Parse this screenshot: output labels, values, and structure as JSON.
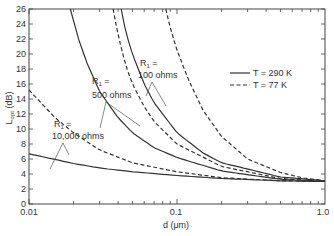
{
  "chart_data": {
    "type": "line",
    "title": "",
    "xlabel": "d (μm)",
    "ylabel": "L_opt (dB)",
    "xscale": "log",
    "xlim": [
      0.01,
      1.0
    ],
    "ylim": [
      0,
      26
    ],
    "x_ticks": [
      "0.01",
      "0.1",
      "1.0"
    ],
    "y_ticks": [
      "0",
      "2",
      "4",
      "6",
      "8",
      "10",
      "12",
      "14",
      "16",
      "18",
      "20",
      "22",
      "24",
      "26"
    ],
    "grid": false,
    "legend": {
      "position": "upper right",
      "entries": [
        {
          "label": "T = 290 K",
          "style": "solid"
        },
        {
          "label": "T = 77 K",
          "style": "dashed"
        }
      ]
    },
    "series": [
      {
        "name": "R1 = 10,000 ohms, T = 290 K",
        "style": "solid",
        "x": [
          0.01,
          0.02,
          0.03,
          0.05,
          0.1,
          0.2,
          0.5,
          1.0
        ],
        "y": [
          6.7,
          5.4,
          4.8,
          4.3,
          3.8,
          3.4,
          3.1,
          3.0
        ]
      },
      {
        "name": "R1 = 10,000 ohms, T = 77 K",
        "style": "dashed",
        "x": [
          0.01,
          0.015,
          0.02,
          0.03,
          0.05,
          0.1,
          0.2,
          0.5,
          1.0
        ],
        "y": [
          15.2,
          11.5,
          9.5,
          7.2,
          5.5,
          4.3,
          3.5,
          3.1,
          3.0
        ]
      },
      {
        "name": "R1 = 500 ohms, T = 290 K",
        "style": "solid",
        "x": [
          0.019,
          0.022,
          0.025,
          0.03,
          0.04,
          0.05,
          0.07,
          0.1,
          0.2,
          0.5,
          1.0
        ],
        "y": [
          26,
          21.5,
          18.5,
          15,
          11.5,
          9.5,
          7.5,
          6.2,
          4.4,
          3.3,
          3.0
        ]
      },
      {
        "name": "R1 = 500 ohms, T = 77 K",
        "style": "dashed",
        "x": [
          0.037,
          0.04,
          0.045,
          0.05,
          0.06,
          0.07,
          0.1,
          0.2,
          0.5,
          1.0
        ],
        "y": [
          26,
          22.5,
          18.5,
          16,
          13,
          11,
          8,
          5,
          3.4,
          3.0
        ]
      },
      {
        "name": "R1 = 100 ohms, T = 290 K",
        "style": "solid",
        "x": [
          0.042,
          0.045,
          0.05,
          0.06,
          0.07,
          0.1,
          0.15,
          0.2,
          0.5,
          1.0
        ],
        "y": [
          26,
          23,
          20,
          16,
          13.5,
          9.5,
          6.8,
          5.5,
          3.6,
          3.1
        ]
      },
      {
        "name": "R1 = 100 ohms, T = 77 K",
        "style": "dashed",
        "x": [
          0.084,
          0.09,
          0.1,
          0.12,
          0.15,
          0.2,
          0.3,
          0.5,
          0.7,
          1.0
        ],
        "y": [
          26,
          23.5,
          20.5,
          16.5,
          12.5,
          9,
          6,
          4.2,
          3.5,
          3.1
        ]
      }
    ],
    "annotations": [
      {
        "text": "R1 = 100 ohms",
        "points_to": [
          "R1=100 solid",
          "R1=100 dashed"
        ]
      },
      {
        "text": "R1 = 500 ohms",
        "points_to": [
          "R1=500 solid",
          "R1=500 dashed"
        ]
      },
      {
        "text": "R1 = 10,000 ohms",
        "points_to": [
          "R1=10000 solid",
          "R1=10000 dashed"
        ]
      }
    ]
  },
  "labels": {
    "xlabel": "d (μm)",
    "ylabel": "L",
    "ylabel_sub": "opt",
    "ylabel_unit": " (dB)",
    "x_tick_0": "0.01",
    "x_tick_1": "0.1",
    "x_tick_2": "1.0",
    "legend_solid": "T = 290 K",
    "legend_dashed": "T = 77 K",
    "ann_100_line1": "R",
    "ann_100_sub": "1",
    "ann_100_eq": " =",
    "ann_100_line2": "100 ohms",
    "ann_500_line1": "R",
    "ann_500_sub": "1",
    "ann_500_eq": " =",
    "ann_500_line2": "500 ohms",
    "ann_10k_line1": "R",
    "ann_10k_sub": "1",
    "ann_10k_eq": " =",
    "ann_10k_line2": "10,000 ohms"
  }
}
